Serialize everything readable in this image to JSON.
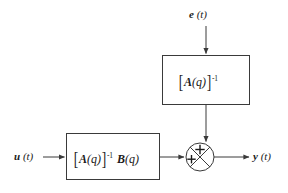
{
  "diagram": {
    "type": "block-diagram",
    "colors": {
      "stroke": "#3a3a3a",
      "text": "#1a1a1a",
      "background": "#ffffff"
    },
    "signals": {
      "noise_input": {
        "var": "e",
        "arg": "(t)",
        "text": "e (t)"
      },
      "control_input": {
        "var": "u",
        "arg": "(t)",
        "text": "u (t)"
      },
      "output": {
        "var": "y",
        "arg": "(t)",
        "text": "y (t)"
      }
    },
    "blocks": [
      {
        "name": "noise-filter-block",
        "expression": "[A(q)]^-1",
        "matrix": "A",
        "argument": "(q)",
        "exponent": "-1",
        "second_matrix": "",
        "second_argument": ""
      },
      {
        "name": "plant-block",
        "expression": "[A(q)]^-1 B(q)",
        "matrix": "A",
        "argument": "(q)",
        "exponent": "-1",
        "second_matrix": "B",
        "second_argument": "(q)"
      }
    ],
    "summing_junction": {
      "name": "summing-junction",
      "sign_top": "+",
      "sign_left": "+",
      "style": "circle-with-cross"
    }
  }
}
